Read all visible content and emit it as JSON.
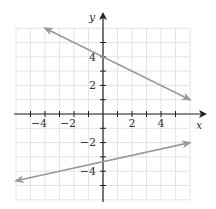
{
  "chart_data": {
    "type": "line",
    "title": "",
    "xlabel": "x",
    "ylabel": "y",
    "xlim": [
      -6,
      6
    ],
    "ylim": [
      -6,
      6
    ],
    "grid": true,
    "x_ticks": [
      -4,
      -2,
      2,
      4
    ],
    "y_ticks": [
      4,
      2,
      -2,
      -4
    ],
    "x_tick_labels": [
      "−4",
      "−2",
      "2",
      "4"
    ],
    "y_tick_labels": [
      "4",
      "2",
      "−2",
      "−4"
    ],
    "series": [
      {
        "name": "upper line",
        "equation": "y = -x/2 + 4",
        "x": [
          -4,
          6
        ],
        "y": [
          6,
          1
        ],
        "color": "#9a9a9a",
        "arrows": "both"
      },
      {
        "name": "lower line",
        "equation": "y = 2x/9 - 10/3",
        "x": [
          -6,
          6
        ],
        "y": [
          -4.67,
          -2
        ],
        "color": "#9a9a9a",
        "arrows": "both"
      }
    ]
  },
  "labels": {
    "x_axis": "x",
    "y_axis": "y",
    "x_ticks": [
      "−4",
      "−2",
      "2",
      "4"
    ],
    "y_ticks": [
      "4",
      "2",
      "−2",
      "−4"
    ]
  }
}
